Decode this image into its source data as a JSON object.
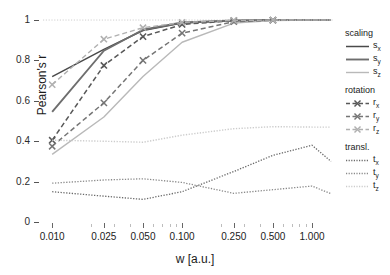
{
  "chart_data": {
    "type": "line",
    "title": "",
    "xlabel": "w [a.u.]",
    "ylabel": "Pearson's r",
    "xscale": "log",
    "xlim": [
      0.0085,
      1.45
    ],
    "ylim": [
      0,
      1.02
    ],
    "grid": false,
    "legend_position": "right",
    "xticks": [
      "0.010",
      "0.025",
      "0.050",
      "0.100",
      "0.250",
      "0.500",
      "1.000"
    ],
    "xtick_values": [
      0.01,
      0.025,
      0.05,
      0.1,
      0.25,
      0.5,
      1.0
    ],
    "yticks": [
      "0",
      "0.2",
      "0.4",
      "0.6",
      "0.8",
      "1"
    ],
    "ytick_values": [
      0,
      0.2,
      0.4,
      0.6,
      0.8,
      1
    ],
    "x": [
      0.01,
      0.025,
      0.05,
      0.1,
      0.25,
      0.5,
      1.0,
      1.4
    ],
    "series": [
      {
        "name": "s_x",
        "group": "scaling",
        "label": "s",
        "sub": "x",
        "style": "solid",
        "marker": "none",
        "color": "#4a4a4a",
        "width": 1.5,
        "values": [
          0.72,
          0.855,
          0.948,
          0.985,
          0.997,
          0.999,
          1.0,
          1.0
        ]
      },
      {
        "name": "s_y",
        "group": "scaling",
        "label": "s",
        "sub": "y",
        "style": "solid",
        "marker": "none",
        "color": "#6e6e6e",
        "width": 1.9,
        "values": [
          0.545,
          0.848,
          0.952,
          0.988,
          0.998,
          1.0,
          1.0,
          1.0
        ]
      },
      {
        "name": "s_z",
        "group": "scaling",
        "label": "s",
        "sub": "z",
        "style": "solid",
        "marker": "none",
        "color": "#b9b9b9",
        "width": 1.4,
        "values": [
          0.335,
          0.52,
          0.72,
          0.89,
          0.985,
          0.998,
          1.0,
          1.0
        ]
      },
      {
        "name": "r_x",
        "group": "rotation",
        "label": "r",
        "sub": "x",
        "style": "dashed",
        "marker": "x",
        "color": "#585858",
        "width": 1.5,
        "values": [
          0.405,
          0.775,
          0.918,
          0.978,
          0.997,
          0.999,
          1.0,
          1.0
        ]
      },
      {
        "name": "r_y",
        "group": "rotation",
        "label": "r",
        "sub": "y",
        "style": "dashed",
        "marker": "x",
        "color": "#757575",
        "width": 1.5,
        "values": [
          0.375,
          0.59,
          0.8,
          0.935,
          0.992,
          0.999,
          1.0,
          1.0
        ]
      },
      {
        "name": "r_z",
        "group": "rotation",
        "label": "r",
        "sub": "z",
        "style": "dashed",
        "marker": "x",
        "color": "#b0b0b0",
        "width": 1.4,
        "values": [
          0.68,
          0.905,
          0.962,
          0.988,
          0.998,
          1.0,
          1.0,
          1.0
        ]
      },
      {
        "name": "t_x",
        "group": "transl.",
        "label": "t",
        "sub": "x",
        "style": "dotted",
        "marker": "none",
        "color": "#6a6a6a",
        "width": 1.3,
        "values": [
          0.15,
          0.128,
          0.112,
          0.15,
          0.25,
          0.33,
          0.38,
          0.3
        ]
      },
      {
        "name": "t_y",
        "group": "transl.",
        "label": "t",
        "sub": "y",
        "style": "dotted",
        "marker": "none",
        "color": "#8a8a8a",
        "width": 1.3,
        "values": [
          0.192,
          0.208,
          0.214,
          0.196,
          0.142,
          0.16,
          0.178,
          0.14
        ]
      },
      {
        "name": "t_z",
        "group": "transl.",
        "label": "t",
        "sub": "z",
        "style": "dotted",
        "marker": "none",
        "color": "#cccccc",
        "width": 1.4,
        "values": [
          0.405,
          0.4,
          0.395,
          0.43,
          0.462,
          0.472,
          0.47,
          0.47
        ]
      }
    ],
    "reference_line": {
      "y": 1.0,
      "style": "dotted",
      "color": "#cfcfcf"
    }
  },
  "legend": {
    "groups": [
      {
        "title": "scaling",
        "series": [
          "s_x",
          "s_y",
          "s_z"
        ]
      },
      {
        "title": "rotation",
        "series": [
          "r_x",
          "r_y",
          "r_z"
        ]
      },
      {
        "title": "transl.",
        "series": [
          "t_x",
          "t_y",
          "t_z"
        ]
      }
    ]
  }
}
